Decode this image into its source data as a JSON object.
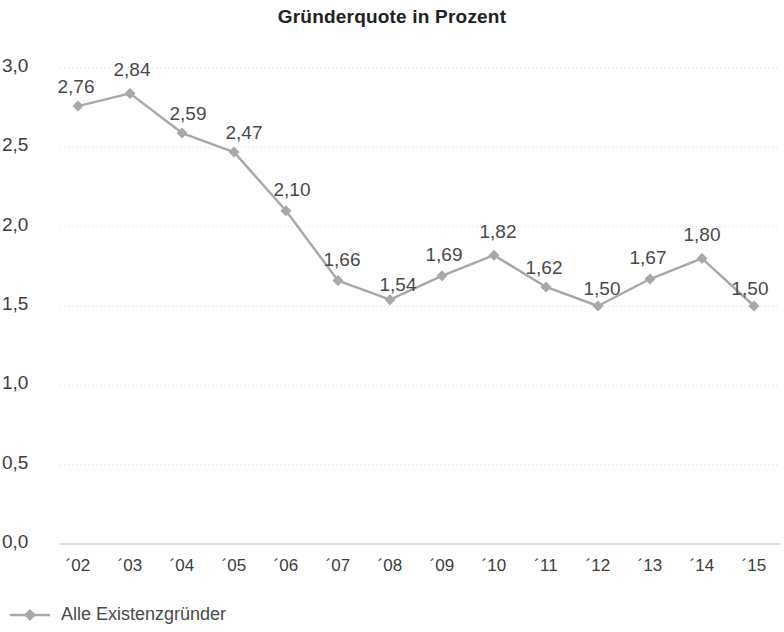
{
  "chart_data": {
    "type": "line",
    "title": "Gründerquote in Prozent",
    "xlabel": "",
    "ylabel": "",
    "ylim": [
      0.0,
      3.0
    ],
    "ytick_values": [
      3.0,
      2.5,
      2.0,
      1.5,
      1.0,
      0.5,
      0.0
    ],
    "ytick_labels": [
      "3,0",
      "2,5",
      "2,0",
      "1,5",
      "1,0",
      "0,5",
      "0,0"
    ],
    "categories": [
      "´02",
      "´03",
      "´04",
      "´05",
      "´06",
      "´07",
      "´08",
      "´09",
      "´10",
      "´11",
      "´12",
      "´13",
      "´14",
      "´15"
    ],
    "grid": true,
    "grid_axis": "y",
    "legend_position": "bottom-left",
    "series": [
      {
        "name": "Alle Existenzgründer",
        "color": "#a8a8a8",
        "marker": "diamond",
        "values": [
          2.76,
          2.84,
          2.59,
          2.47,
          2.1,
          1.66,
          1.54,
          1.69,
          1.82,
          1.62,
          1.5,
          1.67,
          1.8,
          1.5
        ],
        "value_labels": [
          "2,76",
          "2,84",
          "2,59",
          "2,47",
          "2,10",
          "1,66",
          "1,54",
          "1,69",
          "1,82",
          "1,62",
          "1,50",
          "1,67",
          "1,80",
          "1,50"
        ],
        "label_offsets": [
          {
            "dx": -2,
            "dy": -30
          },
          {
            "dx": 2,
            "dy": -34
          },
          {
            "dx": 6,
            "dy": -30
          },
          {
            "dx": 10,
            "dy": -30
          },
          {
            "dx": 6,
            "dy": -32
          },
          {
            "dx": 4,
            "dy": -32
          },
          {
            "dx": 8,
            "dy": -26
          },
          {
            "dx": 2,
            "dy": -32
          },
          {
            "dx": 4,
            "dy": -34
          },
          {
            "dx": -2,
            "dy": -30
          },
          {
            "dx": 4,
            "dy": -28
          },
          {
            "dx": -2,
            "dy": -32
          },
          {
            "dx": 0,
            "dy": -34
          },
          {
            "dx": -4,
            "dy": -28
          }
        ]
      }
    ]
  },
  "legend": {
    "entries": [
      {
        "label": "Alle Existenzgründer",
        "color": "#a8a8a8"
      }
    ]
  },
  "colors": {
    "series": "#a8a8a8",
    "grid": "#dcdcdc",
    "axis_text": "#3d3d3d",
    "title": "#222222",
    "label_text": "#4a4a4a"
  }
}
